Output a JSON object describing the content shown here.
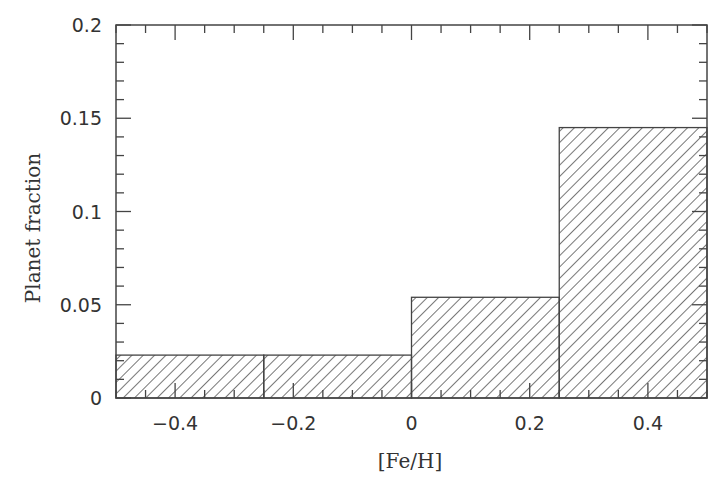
{
  "chart_data": {
    "type": "bar",
    "title": "",
    "xlabel": "[Fe/H]",
    "ylabel": "Planet fraction",
    "xlim": [
      -0.5,
      0.5
    ],
    "ylim": [
      0,
      0.2
    ],
    "bins": [
      {
        "x0": -0.5,
        "x1": -0.25,
        "value": 0.023
      },
      {
        "x0": -0.25,
        "x1": 0.0,
        "value": 0.023
      },
      {
        "x0": 0.0,
        "x1": 0.25,
        "value": 0.054
      },
      {
        "x0": 0.25,
        "x1": 0.5,
        "value": 0.145
      }
    ],
    "categories": [
      "-0.5 to -0.25",
      "-0.25 to 0",
      "0 to 0.25",
      "0.25 to 0.5"
    ],
    "values": [
      0.023,
      0.023,
      0.054,
      0.145
    ],
    "x_ticks": [
      -0.4,
      -0.2,
      0,
      0.2,
      0.4
    ],
    "x_tick_labels": [
      "−0.4",
      "−0.2",
      "0",
      "0.2",
      "0.4"
    ],
    "x_minor_step": 0.05,
    "y_ticks": [
      0,
      0.05,
      0.1,
      0.15,
      0.2
    ],
    "y_tick_labels": [
      "0",
      "0.05",
      "0.1",
      "0.15",
      "0.2"
    ],
    "y_minor_step": 0.01,
    "grid": false,
    "legend": null,
    "fill": "diagonal-hatch",
    "colors": {
      "axis": "#444444",
      "hatch": "#555555",
      "text": "#333333"
    }
  }
}
